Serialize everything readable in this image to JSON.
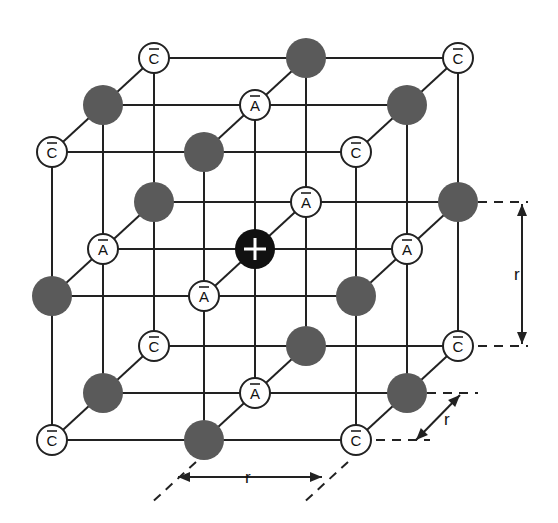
{
  "diagram": {
    "colors": {
      "line": "#222222",
      "gray_ion": "#5a5a5a",
      "center_ion": "#111111",
      "label_ion_fill": "#ffffff"
    },
    "labels": {
      "anion": "A",
      "cation": "C",
      "center": "+",
      "distance": "r"
    },
    "lattice": {
      "origin": [
        52,
        440
      ],
      "step_x": 152,
      "step_y": -144,
      "depth_dx": 51,
      "depth_dy": -47,
      "nodes": [
        {
          "i": 0,
          "j": 0,
          "k": 0,
          "type": "C"
        },
        {
          "i": 1,
          "j": 0,
          "k": 0,
          "type": "gray"
        },
        {
          "i": 2,
          "j": 0,
          "k": 0,
          "type": "C"
        },
        {
          "i": 0,
          "j": 1,
          "k": 0,
          "type": "gray"
        },
        {
          "i": 1,
          "j": 1,
          "k": 0,
          "type": "A"
        },
        {
          "i": 2,
          "j": 1,
          "k": 0,
          "type": "gray"
        },
        {
          "i": 0,
          "j": 2,
          "k": 0,
          "type": "C"
        },
        {
          "i": 1,
          "j": 2,
          "k": 0,
          "type": "gray"
        },
        {
          "i": 2,
          "j": 2,
          "k": 0,
          "type": "C"
        },
        {
          "i": 0,
          "j": 0,
          "k": 1,
          "type": "gray"
        },
        {
          "i": 1,
          "j": 0,
          "k": 1,
          "type": "A"
        },
        {
          "i": 2,
          "j": 0,
          "k": 1,
          "type": "gray"
        },
        {
          "i": 0,
          "j": 1,
          "k": 1,
          "type": "A"
        },
        {
          "i": 1,
          "j": 1,
          "k": 1,
          "type": "center"
        },
        {
          "i": 2,
          "j": 1,
          "k": 1,
          "type": "A"
        },
        {
          "i": 0,
          "j": 2,
          "k": 1,
          "type": "gray"
        },
        {
          "i": 1,
          "j": 2,
          "k": 1,
          "type": "A"
        },
        {
          "i": 2,
          "j": 2,
          "k": 1,
          "type": "gray"
        },
        {
          "i": 0,
          "j": 0,
          "k": 2,
          "type": "C"
        },
        {
          "i": 1,
          "j": 0,
          "k": 2,
          "type": "gray"
        },
        {
          "i": 2,
          "j": 0,
          "k": 2,
          "type": "C"
        },
        {
          "i": 0,
          "j": 1,
          "k": 2,
          "type": "gray"
        },
        {
          "i": 1,
          "j": 1,
          "k": 2,
          "type": "A"
        },
        {
          "i": 2,
          "j": 1,
          "k": 2,
          "type": "gray"
        },
        {
          "i": 0,
          "j": 2,
          "k": 2,
          "type": "C"
        },
        {
          "i": 1,
          "j": 2,
          "k": 2,
          "type": "gray"
        },
        {
          "i": 2,
          "j": 2,
          "k": 2,
          "type": "C"
        }
      ]
    },
    "dimensions": [
      {
        "name": "vertical-r",
        "label": "r"
      },
      {
        "name": "depth-r",
        "label": "r"
      },
      {
        "name": "horizontal-r",
        "label": "r"
      }
    ]
  }
}
